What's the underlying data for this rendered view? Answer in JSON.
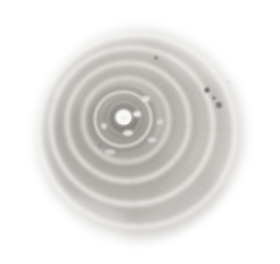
{
  "image": {
    "subject": "gastropod-shell",
    "view": "apical-umbilical-view",
    "medium": "halftone-grayscale-photograph",
    "width": 280,
    "height": 264,
    "background_color": "#ffffff",
    "description": "Grayscale halftone photograph of a coiled snail shell seen from above, showing concentric whorls radiating from a bright white central umbilicus, on a plain white background."
  },
  "palette": {
    "background": "#ffffff",
    "shell_light": "#e3e1dd",
    "shell_midlight": "#cac7c2",
    "shell_mid": "#b0ada7",
    "shell_dark": "#8e8b86",
    "shell_darkest": "#6f6c68",
    "groove_highlight": "#f2f1ee",
    "core_white": "#ffffff",
    "speck_dark": "#4a4844"
  },
  "geometry": {
    "center_x": 124,
    "center_y": 118,
    "outline_radius_x": 108,
    "outline_radius_y": 111,
    "outline_center_x": 140,
    "outline_center_y": 134
  },
  "core": {
    "label": "umbilicus-highlight",
    "cx": 124,
    "cy": 118,
    "r": 8,
    "color": "#ffffff"
  },
  "whorls": [
    {
      "label": "whorl-1-inner",
      "cx": 124,
      "cy": 118,
      "rx": 17,
      "ry": 17,
      "rotation": -12,
      "band": "#97948f",
      "groove": "#ded9d2"
    },
    {
      "label": "whorl-2",
      "cx": 123,
      "cy": 119,
      "rx": 29,
      "ry": 28,
      "rotation": -10,
      "band": "#8d8a85",
      "groove": "#e6e2db"
    },
    {
      "label": "whorl-3",
      "cx": 126,
      "cy": 120,
      "rx": 44,
      "ry": 43,
      "rotation": -6,
      "band": "#989590",
      "groove": "#efece6"
    },
    {
      "label": "whorl-4",
      "cx": 128,
      "cy": 122,
      "rx": 62,
      "ry": 60,
      "rotation": -4,
      "band": "#a8a5a0",
      "groove": "#f1efe9"
    },
    {
      "label": "whorl-5",
      "cx": 132,
      "cy": 126,
      "rx": 82,
      "ry": 79,
      "rotation": 0,
      "band": "#bcb9b4",
      "groove": "#f4f2ee"
    },
    {
      "label": "whorl-6-outer",
      "cx": 137,
      "cy": 131,
      "rx": 99,
      "ry": 97,
      "rotation": 3,
      "band": "#cecbc6",
      "groove": "#f7f6f3"
    }
  ],
  "specks": [
    {
      "label": "speck-right-upper",
      "cx": 207,
      "cy": 90,
      "r": 2.6,
      "color": "#4a4844"
    },
    {
      "label": "speck-right-mid",
      "cx": 214,
      "cy": 98,
      "r": 1.8,
      "color": "#5c5a56"
    },
    {
      "label": "speck-right-lower",
      "cx": 219,
      "cy": 105,
      "r": 3.0,
      "color": "#565450"
    },
    {
      "label": "speck-top",
      "cx": 156,
      "cy": 58,
      "r": 1.7,
      "color": "#62605c"
    },
    {
      "label": "speck-right-edge",
      "cx": 229,
      "cy": 82,
      "r": 1.4,
      "color": "#6b6965"
    },
    {
      "label": "speck-inner-left",
      "cx": 100,
      "cy": 146,
      "r": 1.6,
      "color": "#6e6c68"
    }
  ],
  "highlights": [
    {
      "label": "fleck-core-right",
      "cx": 137,
      "cy": 114,
      "rx": 4,
      "ry": 3,
      "color": "#fbfaf8"
    },
    {
      "label": "fleck-core-below",
      "cx": 128,
      "cy": 133,
      "rx": 5,
      "ry": 3,
      "color": "#f6f4f1"
    },
    {
      "label": "fleck-upper",
      "cx": 146,
      "cy": 99,
      "rx": 4,
      "ry": 3,
      "color": "#f3f1ed"
    },
    {
      "label": "fleck-left",
      "cx": 104,
      "cy": 126,
      "rx": 3,
      "ry": 3,
      "color": "#eeece8"
    }
  ]
}
